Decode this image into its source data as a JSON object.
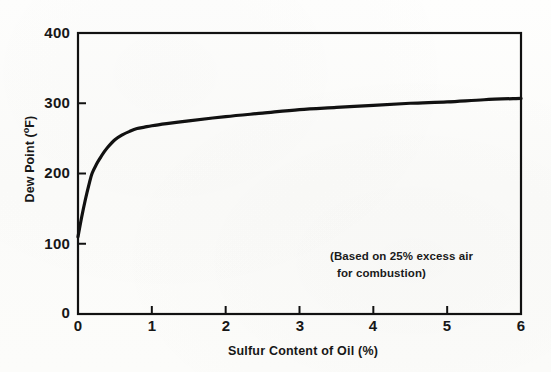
{
  "chart_data": {
    "type": "line",
    "title": "",
    "subtitle": "",
    "xlabel": "Sulfur Content of Oil (%)",
    "ylabel": "Dew Point (°F)",
    "ylabel_main": "Dew Point (",
    "ylabel_unit_sup": "o",
    "ylabel_unit_tail": "F)",
    "xlim": [
      0,
      6
    ],
    "ylim": [
      0,
      400
    ],
    "xticks": [
      0,
      1,
      2,
      3,
      4,
      5,
      6
    ],
    "yticks": [
      0,
      100,
      200,
      300,
      400
    ],
    "xtick_labels": [
      "0",
      "1",
      "2",
      "3",
      "4",
      "5",
      "6"
    ],
    "ytick_labels": [
      "0",
      "100",
      "200",
      "300",
      "400"
    ],
    "grid": false,
    "legend": false,
    "legend_position": "none",
    "annotations": [
      {
        "text": "(Based on 25% excess air for combustion)",
        "line1": "(Based on 25% excess air",
        "line2": "for combustion)",
        "x": 3.45,
        "y": 90
      }
    ],
    "series": [
      {
        "name": "Dew Point vs Sulfur Content",
        "color": "#111111",
        "linewidth": 3.2,
        "x": [
          0.0,
          0.05,
          0.1,
          0.15,
          0.19,
          0.25,
          0.3,
          0.35,
          0.4,
          0.5,
          0.6,
          0.7,
          0.8,
          0.9,
          1.0,
          1.2,
          1.5,
          2.0,
          2.5,
          3.0,
          3.5,
          4.0,
          4.5,
          5.0,
          5.5,
          6.0
        ],
        "y": [
          110,
          138,
          163,
          185,
          200,
          213,
          222,
          230,
          237,
          248,
          255,
          260,
          264,
          266,
          268,
          271,
          275,
          281,
          286,
          291,
          294,
          297,
          300,
          302,
          305,
          307
        ]
      }
    ]
  },
  "axes": {
    "frame_color": "#111111",
    "background": "#fdfdfb"
  }
}
